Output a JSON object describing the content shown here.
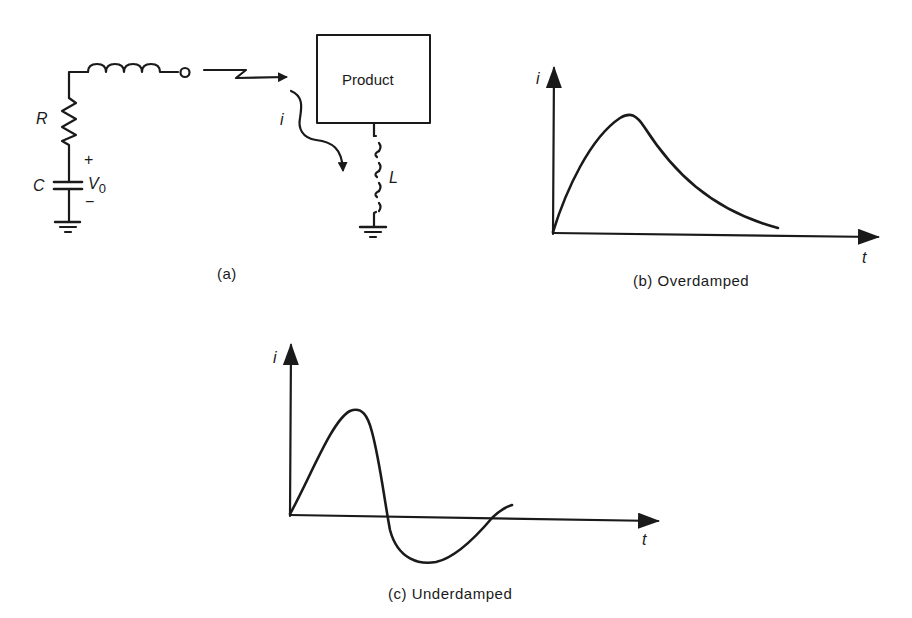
{
  "figure": {
    "panel_a": {
      "caption": "(a)",
      "labels": {
        "resistor": "R",
        "capacitor": "C",
        "plus": "+",
        "voltage": "V",
        "voltage_subscript": "0",
        "minus": "−",
        "current": "i",
        "inductor": "L",
        "product": "Product"
      }
    },
    "panel_b": {
      "caption": "(b)  Overdamped",
      "y_label": "i",
      "x_label": "t"
    },
    "panel_c": {
      "caption": "(c)  Underdamped",
      "y_label": "i",
      "x_label": "t"
    },
    "colors": {
      "ink": "#1a1a1a",
      "background": "#ffffff"
    }
  }
}
